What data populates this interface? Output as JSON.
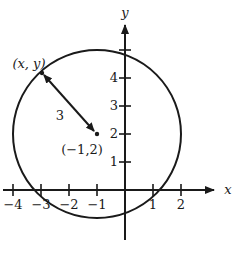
{
  "diagram": {
    "type": "coordinate-plane-circle",
    "axes": {
      "x_label": "x",
      "y_label": "y",
      "x_ticks": [
        {
          "value": -4,
          "label": "−4"
        },
        {
          "value": -3,
          "label": "−3"
        },
        {
          "value": -2,
          "label": "−2"
        },
        {
          "value": -1,
          "label": "−1"
        },
        {
          "value": 1,
          "label": "1"
        },
        {
          "value": 2,
          "label": "2"
        }
      ],
      "y_ticks": [
        {
          "value": 1,
          "label": "1"
        },
        {
          "value": 2,
          "label": "2"
        },
        {
          "value": 3,
          "label": "3"
        },
        {
          "value": 4,
          "label": "4"
        },
        {
          "value": 5,
          "label": ""
        }
      ]
    },
    "circle": {
      "center": [
        -1,
        2
      ],
      "radius": 3,
      "center_label": "(−1,2)"
    },
    "point": {
      "label": "(x, y)"
    },
    "radius_label": "3",
    "colors": {
      "stroke": "#1a1a1a",
      "background": "#ffffff"
    }
  }
}
